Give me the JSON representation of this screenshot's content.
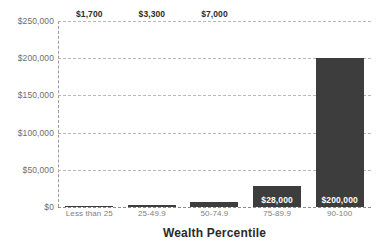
{
  "chart_data": {
    "type": "bar",
    "title": "",
    "xlabel": "Wealth Percentile",
    "ylabel": "",
    "categories": [
      "Less than 25",
      "25-49.9",
      "50-74.9",
      "75-89.9",
      "90-100"
    ],
    "values": [
      1700,
      3300,
      7000,
      28000,
      200000
    ],
    "data_labels": [
      "$1,700",
      "$3,300",
      "$7,000",
      "$28,000",
      "$200,000"
    ],
    "ylim": [
      0,
      250000
    ],
    "yticks": [
      0,
      50000,
      100000,
      150000,
      200000,
      250000
    ],
    "ytick_labels": [
      "$0",
      "$50,000",
      "$100,000",
      "$150,000",
      "$200,000",
      "$250,000"
    ],
    "grid": true,
    "grid_style": "dashed-horizontal",
    "legend": "none",
    "bar_color": "#3d3d3d",
    "grid_color": "#b9b9b9",
    "tick_label_color": "#6d6d6d",
    "axis_title_color": "#2b2b2b",
    "background_color": "#ffffff"
  }
}
